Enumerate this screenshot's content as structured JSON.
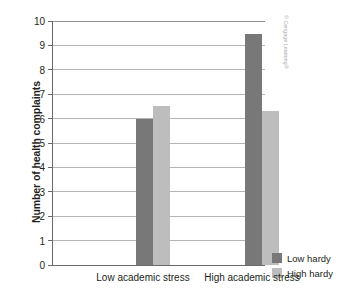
{
  "chart_data": {
    "type": "bar",
    "title": "",
    "xlabel": "",
    "ylabel": "Number of health complaints",
    "categories": [
      "Low academic stress",
      "High academic stress"
    ],
    "series": [
      {
        "name": "Low hardy",
        "color": "#787878",
        "values": [
          6.0,
          9.45
        ]
      },
      {
        "name": "High hardy",
        "color": "#bdbdbd",
        "values": [
          6.5,
          6.3
        ]
      }
    ],
    "ylim": [
      0,
      10
    ],
    "yticks": [
      0,
      1,
      2,
      3,
      4,
      5,
      6,
      7,
      8,
      9,
      10
    ],
    "ytick_labels": [
      "0",
      "1",
      "2",
      "3",
      "4",
      "5",
      "6",
      "7",
      "8",
      "9",
      "10"
    ],
    "grid": true,
    "grid_axis": "y",
    "legend_position": "right-bottom"
  },
  "legend": {
    "entries": [
      {
        "label": "Low hardy",
        "color": "#787878"
      },
      {
        "label": "High hardy",
        "color": "#bdbdbd"
      }
    ]
  },
  "credit": {
    "text": "© Cengage Learning®"
  }
}
